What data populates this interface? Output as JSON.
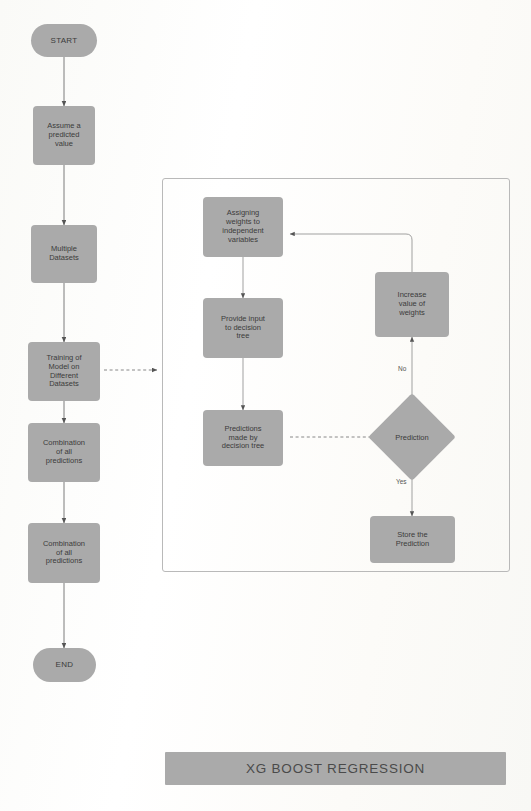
{
  "diagram": {
    "title": "XG BOOST REGRESSION",
    "colors": {
      "node_fill": "#aaaaaa",
      "node_text": "#3b3b3b",
      "connector": "#6e6e6e",
      "container_border": "#b9b9b9",
      "background": "#fbfbf9"
    },
    "left_flow": [
      {
        "id": "start",
        "label": "START",
        "shape": "pill"
      },
      {
        "id": "assume",
        "label": "Assume a\npredicted\nvalue",
        "shape": "process"
      },
      {
        "id": "datasets",
        "label": "Multiple\nDatasets",
        "shape": "process"
      },
      {
        "id": "training",
        "label": "Training of\nModel on\nDifferent\nDatasets",
        "shape": "process"
      },
      {
        "id": "combination1",
        "label": "Combination\nof all\npredictions",
        "shape": "process"
      },
      {
        "id": "combination2",
        "label": "Combination\nof all\npredictions",
        "shape": "process"
      },
      {
        "id": "end",
        "label": "END",
        "shape": "pill"
      }
    ],
    "subprocess": {
      "nodes": [
        {
          "id": "assign_weights",
          "label": "Assigning\nweights to\nindependent\nvariables",
          "shape": "process"
        },
        {
          "id": "provide_input",
          "label": "Provide input\nto decision\ntree",
          "shape": "process"
        },
        {
          "id": "predictions_made",
          "label": "Predictions\nmade by\ndecision tree",
          "shape": "process"
        },
        {
          "id": "increase_weights",
          "label": "Increase\nvalue of\nweights",
          "shape": "process"
        },
        {
          "id": "prediction",
          "label": "Prediction",
          "shape": "decision"
        },
        {
          "id": "store_prediction",
          "label": "Store the\nPrediction",
          "shape": "process"
        }
      ],
      "edge_labels": {
        "no": "No",
        "yes": "Yes"
      }
    }
  }
}
